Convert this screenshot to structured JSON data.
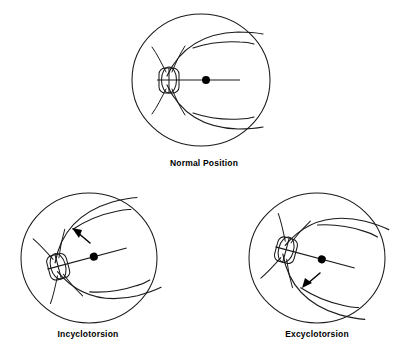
{
  "figure": {
    "background_color": "#ffffff",
    "ink_color": "#1a1a1a",
    "width": 408,
    "height": 356
  },
  "panels": [
    {
      "id": "normal",
      "label": "Normal Position",
      "label_x": 204,
      "label_y": 166,
      "center_x": 201,
      "center_y": 80,
      "radius_x": 69,
      "radius_y": 66,
      "rotation_deg": 0,
      "disc_offset_x": -32,
      "fovea_offset_x": 5,
      "fovea_radius": 4,
      "has_arrow": false,
      "arrow": null
    },
    {
      "id": "incyclotorsion",
      "label": "Incyclotorsion",
      "label_x": 88,
      "label_y": 337,
      "center_x": 89,
      "center_y": 258,
      "radius_x": 68,
      "radius_y": 65,
      "rotation_deg": -15,
      "disc_offset_x": -32,
      "fovea_offset_x": 5,
      "fovea_radius": 4,
      "has_arrow": true,
      "arrow": {
        "direction": "up-left",
        "from_x": 91,
        "from_y": 243,
        "to_x": 75,
        "to_y": 230,
        "head_angle_deg": 219
      }
    },
    {
      "id": "excyclotorsion",
      "label": "Excyclotorsion",
      "label_x": 317,
      "label_y": 337,
      "center_x": 317,
      "center_y": 258,
      "radius_x": 68,
      "radius_y": 65,
      "rotation_deg": 15,
      "disc_offset_x": -32,
      "fovea_offset_x": 5,
      "fovea_radius": 4,
      "has_arrow": true,
      "arrow": {
        "direction": "down-left",
        "from_x": 321,
        "from_y": 272,
        "to_x": 305,
        "to_y": 286,
        "head_angle_deg": 139
      }
    }
  ],
  "anatomy": {
    "optic_disc_label": "optic-disc",
    "fovea_label": "fovea",
    "horizontal_axis_label": "horizontal-raphe",
    "superior_arcade_label": "superior-temporal-arcade",
    "inferior_arcade_label": "inferior-temporal-arcade",
    "nasal_vessels_label": "nasal-vessels"
  }
}
